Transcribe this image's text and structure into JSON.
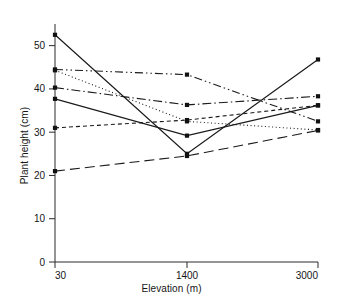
{
  "chart_data": {
    "type": "line",
    "title": "",
    "xlabel": "Elevation (m)",
    "ylabel": "Plant height (cm)",
    "x": [
      30,
      1400,
      3000
    ],
    "xtick_labels": [
      "30",
      "1400",
      "3000"
    ],
    "ytick_labels": [
      "0",
      "10",
      "20",
      "30",
      "40",
      "50"
    ],
    "yticks": [
      0,
      10,
      20,
      30,
      40,
      50
    ],
    "ylim": [
      0,
      55
    ],
    "grid": false,
    "legend": "none",
    "marker": "square",
    "series": [
      {
        "name": "series-1",
        "style": "solid",
        "values": [
          52.5,
          25.0,
          46.8
        ]
      },
      {
        "name": "series-2",
        "style": "dash-dot-dot",
        "values": [
          44.5,
          43.3,
          32.5
        ]
      },
      {
        "name": "series-3",
        "style": "dotted",
        "values": [
          44.3,
          32.5,
          30.5
        ]
      },
      {
        "name": "series-4",
        "style": "dash-dot",
        "values": [
          40.3,
          36.3,
          38.3
        ]
      },
      {
        "name": "series-5",
        "style": "solid-thin",
        "values": [
          37.7,
          29.2,
          36.2
        ]
      },
      {
        "name": "series-6",
        "style": "short-dash",
        "values": [
          31.0,
          32.8,
          36.2
        ]
      },
      {
        "name": "series-7",
        "style": "long-dash",
        "values": [
          21.0,
          24.5,
          30.4
        ]
      }
    ]
  },
  "axes": {
    "x_axis_label": "Elevation (m)",
    "y_axis_label": "Plant height (cm)"
  }
}
